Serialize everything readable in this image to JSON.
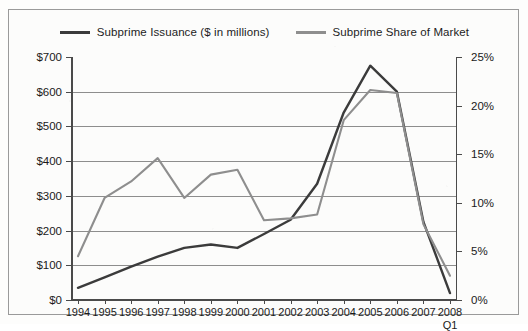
{
  "legend": {
    "items": [
      {
        "label": "Subprime Issuance ($ in millions)",
        "color": "#3b3b3b",
        "key": "issuance"
      },
      {
        "label": "Subprime Share of Market",
        "color": "#8e8e8e",
        "key": "share"
      }
    ]
  },
  "axes": {
    "left_ticks": [
      "$700",
      "$600",
      "$500",
      "$400",
      "$300",
      "$200",
      "$100",
      "$0"
    ],
    "right_ticks": [
      "25%",
      "20%",
      "15%",
      "10%",
      "5%",
      "0%"
    ],
    "x_ticks": [
      "1994",
      "1995",
      "1996",
      "1997",
      "1998",
      "1999",
      "2000",
      "2001",
      "2002",
      "2003",
      "2004",
      "2005",
      "2006",
      "2007",
      "2008"
    ],
    "x_last_sublabel": "Q1"
  },
  "chart_data": {
    "type": "line",
    "title": "",
    "xlabel": "",
    "ylabel": "",
    "categories": [
      "1994",
      "1995",
      "1996",
      "1997",
      "1998",
      "1999",
      "2000",
      "2001",
      "2002",
      "2003",
      "2004",
      "2005",
      "2006",
      "2007",
      "2008 Q1"
    ],
    "series": [
      {
        "name": "Subprime Issuance ($ in millions)",
        "axis": "left",
        "unit": "$ millions",
        "color": "#3b3b3b",
        "values": [
          35,
          65,
          96,
          125,
          150,
          160,
          150,
          190,
          231,
          335,
          540,
          675,
          600,
          225,
          20
        ]
      },
      {
        "name": "Subprime Share of Market",
        "axis": "right",
        "unit": "percent",
        "color": "#8e8e8e",
        "values": [
          4.5,
          10.5,
          12.2,
          14.6,
          10.5,
          12.9,
          13.4,
          8.2,
          8.4,
          8.8,
          18.5,
          21.6,
          21.3,
          7.8,
          2.5
        ]
      }
    ],
    "ylim_left": [
      0,
      700
    ],
    "ylim_right": [
      0,
      25
    ],
    "grid": true,
    "legend_position": "top"
  }
}
